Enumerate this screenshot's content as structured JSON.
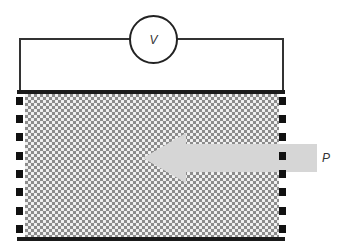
{
  "diagram": {
    "type": "piezoelectric measurement schematic",
    "voltmeter": {
      "label": "V",
      "icon": "voltmeter-icon"
    },
    "pressure": {
      "label": "P",
      "icon": "arrow-left-icon",
      "direction": "left"
    },
    "material": {
      "pattern": "checkered granular texture"
    },
    "electrodes": {
      "left_count": 8,
      "right_count": 8
    },
    "colors": {
      "wire": "#333333",
      "plate": "#1a1a1a",
      "material_base": "#8c8c8c",
      "material_grain": "#f2f2f2",
      "arrow": "#d6d6d6",
      "electrode": "#111111"
    }
  }
}
